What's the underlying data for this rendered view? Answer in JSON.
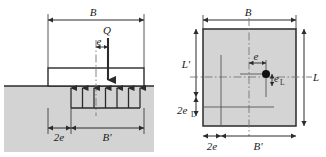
{
  "figure": {
    "colors": {
      "soil_fill": "#d3d3d3",
      "footing_fill": "#ffffff",
      "plan_fill": "#d4d4d4",
      "line": "#2b2b2b",
      "dash": "#555555",
      "background": "#ffffff"
    }
  },
  "section_view": {
    "name": "section-elevation-view",
    "labels": {
      "width_B": "B",
      "load_Q": "Q",
      "eccentricity_e": "e",
      "offset_2e": "2e",
      "effective_width_Bp": "B'"
    },
    "pressure_arrow_count": 7
  },
  "plan_view": {
    "name": "plan-view",
    "labels": {
      "width_B": "B",
      "length_L": "L",
      "effective_length_Lp": "L'",
      "eccentricity_e": "e",
      "eccentricity_eL_base": "e",
      "eccentricity_eL_sub": "L",
      "offset_2eL_base": "2e",
      "offset_2eL_sub": "L",
      "offset_2e": "2e",
      "effective_width_Bp": "B'"
    },
    "load_point": "load-application-point"
  }
}
